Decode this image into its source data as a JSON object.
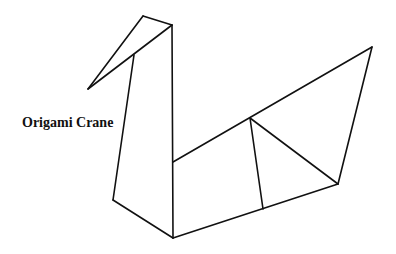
{
  "diagram": {
    "label": "Origami Crane",
    "stroke_color": "#111111",
    "background": "#ffffff",
    "lines": [
      {
        "id": "beak-upper",
        "x1": 88,
        "y1": 89,
        "x2": 143,
        "y2": 16
      },
      {
        "id": "head-top",
        "x1": 143,
        "y1": 16,
        "x2": 172,
        "y2": 25
      },
      {
        "id": "beak-lower",
        "x1": 88,
        "y1": 89,
        "x2": 172,
        "y2": 25
      },
      {
        "id": "neck-back",
        "x1": 172,
        "y1": 25,
        "x2": 173,
        "y2": 238
      },
      {
        "id": "neck-front",
        "x1": 134,
        "y1": 55,
        "x2": 113,
        "y2": 200
      },
      {
        "id": "breast",
        "x1": 113,
        "y1": 200,
        "x2": 173,
        "y2": 238
      },
      {
        "id": "body-top",
        "x1": 173,
        "y1": 162,
        "x2": 372,
        "y2": 47
      },
      {
        "id": "tail-back",
        "x1": 372,
        "y1": 47,
        "x2": 338,
        "y2": 184
      },
      {
        "id": "body-bottom",
        "x1": 173,
        "y1": 238,
        "x2": 338,
        "y2": 184
      },
      {
        "id": "wing-vertical",
        "x1": 250,
        "y1": 118,
        "x2": 263,
        "y2": 209
      },
      {
        "id": "wing-diagonal",
        "x1": 250,
        "y1": 118,
        "x2": 338,
        "y2": 184
      }
    ]
  }
}
